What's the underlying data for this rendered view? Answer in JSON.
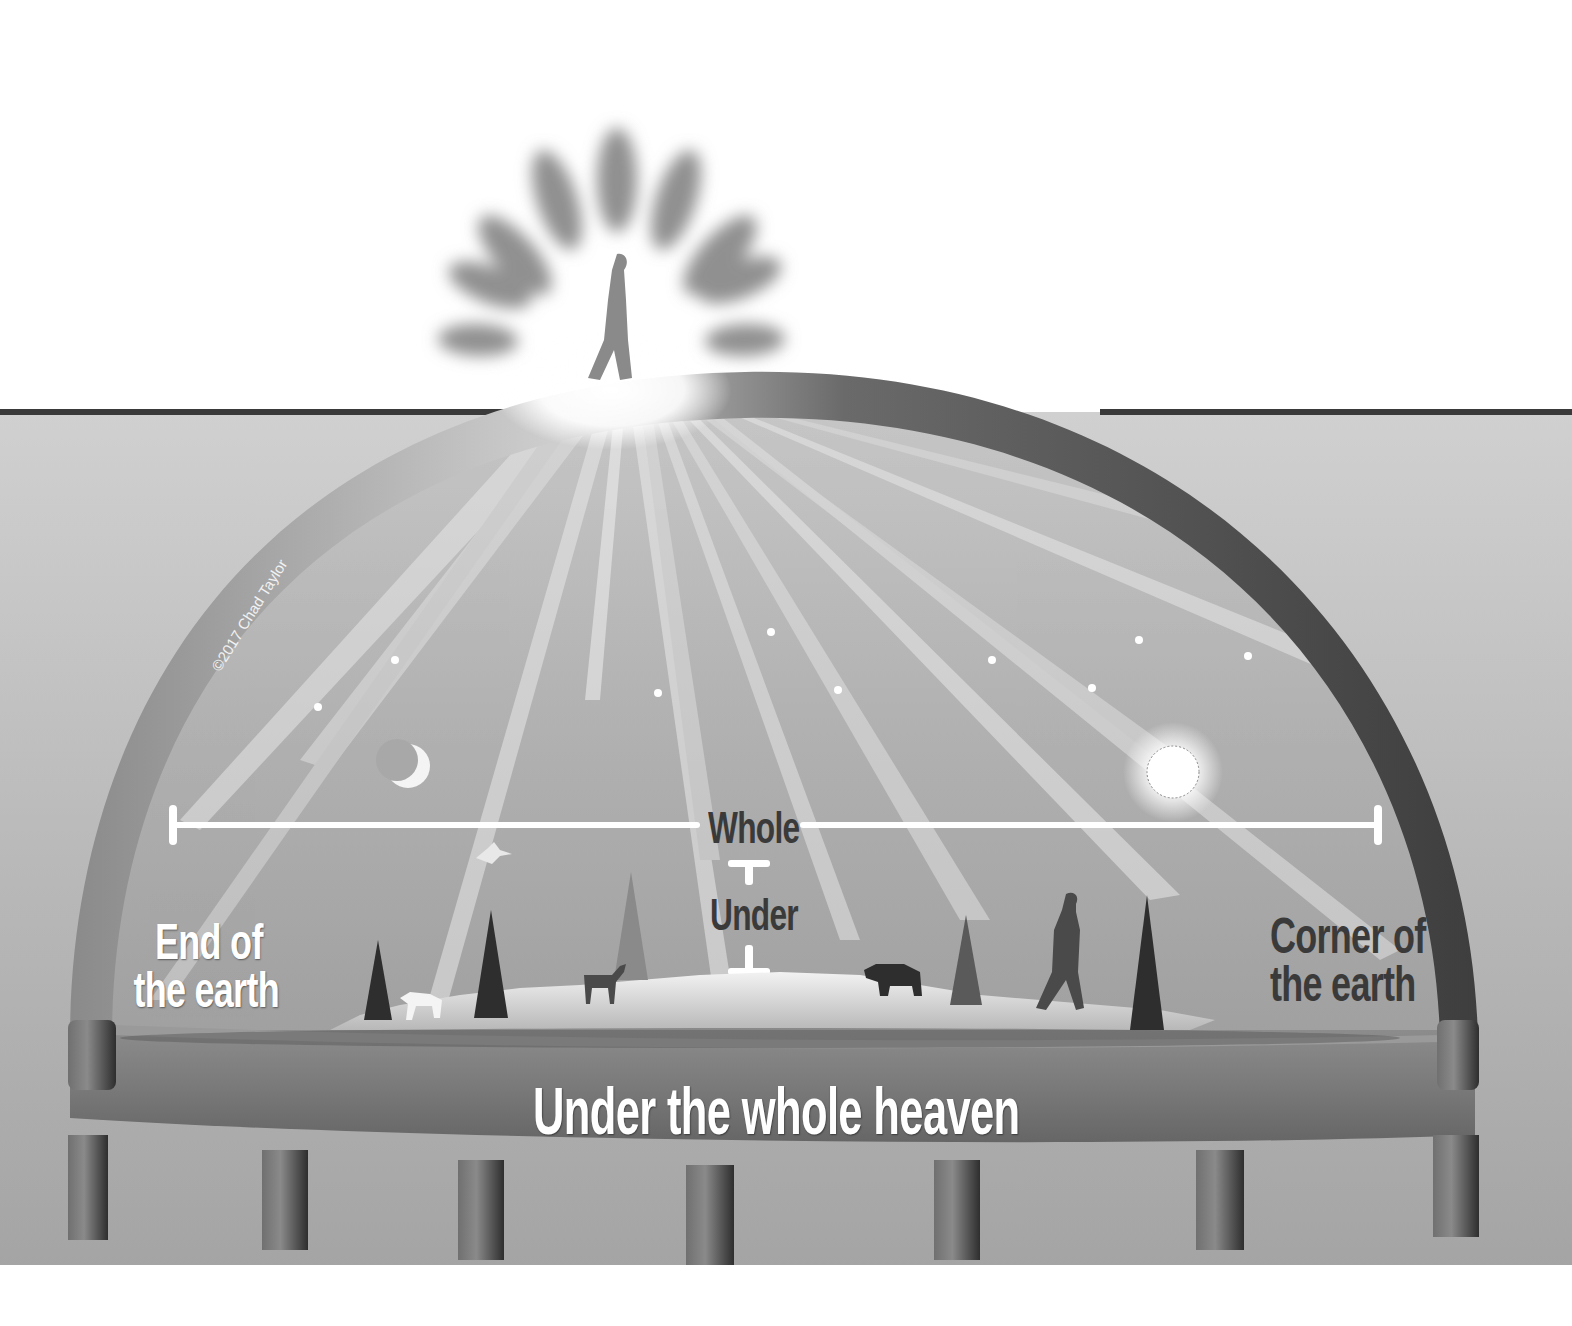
{
  "diagram": {
    "title": "Under the whole heaven",
    "labels": {
      "whole": "Whole",
      "under": "Under",
      "end_of_earth": [
        "End of",
        "the earth"
      ],
      "corner_of_earth": [
        "Corner of",
        "the earth"
      ],
      "under_whole_heaven": "Under the whole heaven",
      "copyright": "©2017 Chad Taylor"
    },
    "elements": [
      "dome-firmament",
      "figure-above-dome",
      "radiant-glory",
      "light-rays",
      "stars",
      "moon",
      "sun",
      "whole-span-bracket",
      "under-bracket",
      "land-with-trees-and-animals",
      "flat-earth-disc",
      "pillars"
    ],
    "colors": {
      "background": "#ffffff",
      "sky": "#a8a8a8",
      "dome": "#4a4a4a",
      "disc": "#7a7a7a",
      "pillar": "#5a5a5a",
      "label_dark": "#3a3a3a",
      "label_light": "#ffffff"
    }
  }
}
